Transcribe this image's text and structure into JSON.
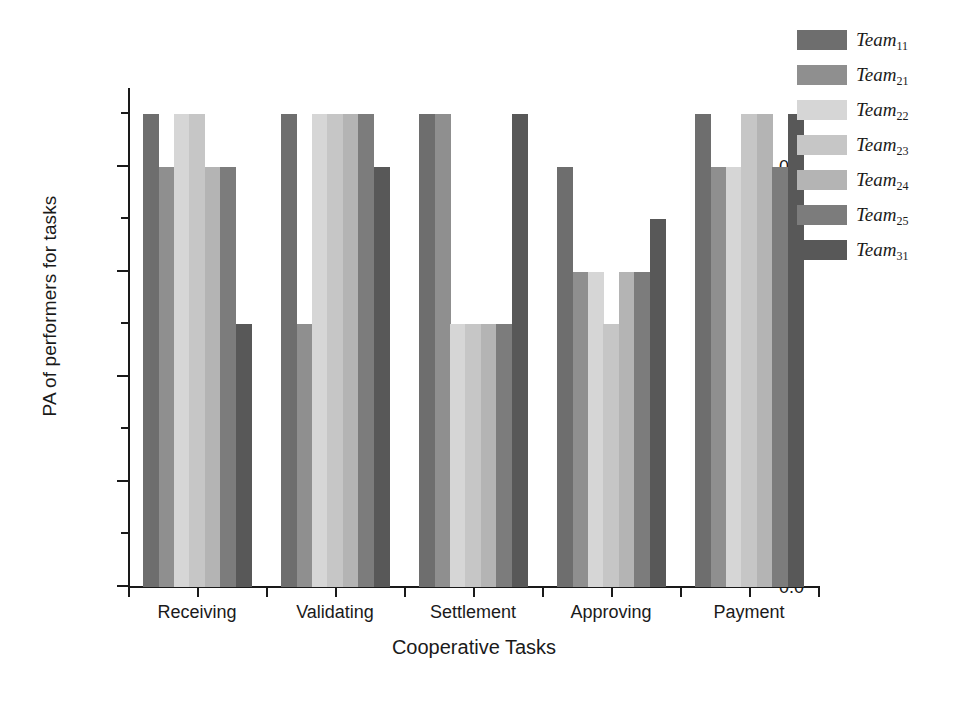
{
  "chart_data": {
    "type": "bar",
    "title": "",
    "xlabel": "Cooperative Tasks",
    "ylabel": "PA of performers for tasks",
    "categories": [
      "Receiving",
      "Validating",
      "Settlement",
      "Approving",
      "Payment"
    ],
    "ylim": [
      0.0,
      0.95
    ],
    "yticks": [
      0.0,
      0.2,
      0.4,
      0.6,
      0.8
    ],
    "ytick_labels": [
      "0.0",
      "0.2",
      "0.4",
      "0.6",
      "0.8"
    ],
    "yminor_step": 0.1,
    "grid": false,
    "legend_position": "right-top",
    "series": [
      {
        "name": "Team11",
        "base": "Team",
        "sub": "11",
        "color": "#6e6e6e",
        "values": [
          0.9,
          0.9,
          0.9,
          0.8,
          0.9
        ]
      },
      {
        "name": "Team21",
        "base": "Team",
        "sub": "21",
        "color": "#8f8f8f",
        "values": [
          0.8,
          0.5,
          0.9,
          0.6,
          0.8
        ]
      },
      {
        "name": "Team22",
        "base": "Team",
        "sub": "22",
        "color": "#d6d6d6",
        "values": [
          0.9,
          0.9,
          0.5,
          0.6,
          0.8
        ]
      },
      {
        "name": "Team23",
        "base": "Team",
        "sub": "23",
        "color": "#c6c6c6",
        "values": [
          0.9,
          0.9,
          0.5,
          0.5,
          0.9
        ]
      },
      {
        "name": "Team24",
        "base": "Team",
        "sub": "24",
        "color": "#b4b4b4",
        "values": [
          0.8,
          0.9,
          0.5,
          0.6,
          0.9
        ]
      },
      {
        "name": "Team25",
        "base": "Team",
        "sub": "25",
        "color": "#7c7c7c",
        "values": [
          0.8,
          0.9,
          0.5,
          0.6,
          0.8
        ]
      },
      {
        "name": "Team31",
        "base": "Team",
        "sub": "31",
        "color": "#585858",
        "values": [
          0.5,
          0.8,
          0.9,
          0.7,
          0.9
        ]
      }
    ]
  },
  "legend": {
    "entries": [
      {
        "label_base": "Team",
        "label_sub": "11",
        "color": "#6e6e6e"
      },
      {
        "label_base": "Team",
        "label_sub": "21",
        "color": "#8f8f8f"
      },
      {
        "label_base": "Team",
        "label_sub": "22",
        "color": "#d6d6d6"
      },
      {
        "label_base": "Team",
        "label_sub": "23",
        "color": "#c6c6c6"
      },
      {
        "label_base": "Team",
        "label_sub": "24",
        "color": "#b4b4b4"
      },
      {
        "label_base": "Team",
        "label_sub": "25",
        "color": "#7c7c7c"
      },
      {
        "label_base": "Team",
        "label_sub": "31",
        "color": "#585858"
      }
    ]
  },
  "axes": {
    "y_title": "PA of performers for tasks",
    "x_title": "Cooperative Tasks"
  }
}
